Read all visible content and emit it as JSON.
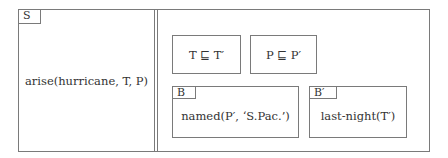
{
  "diagram": {
    "left_box": {
      "tag": "S",
      "content": "arise(hurricane, T, P)"
    },
    "right_box": {
      "conditions": [
        {
          "content": "T ⊑ T′"
        },
        {
          "content": "P ⊑ P′"
        }
      ],
      "sub_boxes": [
        {
          "tag": "B",
          "content": "named(P′, ‘S.Pac.’)"
        },
        {
          "tag": "B′",
          "content": "last-night(T′)"
        }
      ]
    }
  }
}
